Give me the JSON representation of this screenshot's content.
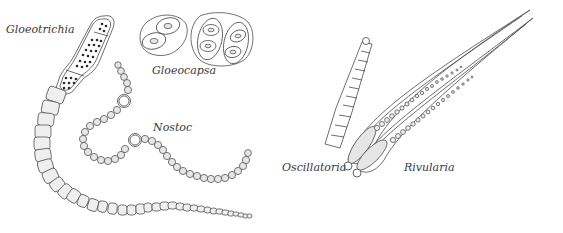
{
  "figure": {
    "background": "#ffffff",
    "ink_color": "#4a4a4a"
  },
  "labels": {
    "gloeotrichia": "Gloeotrichia",
    "gloeocapsa": "Gloeocapsa",
    "nostoc": "Nostoc",
    "oscillatoria": "Oscillatoria",
    "rivularia": "Rivularia"
  },
  "organisms": [
    {
      "name": "Gloeotrichia",
      "form": "tapering filament with basal akinetes"
    },
    {
      "name": "Gloeocapsa",
      "form": "colonies of cells in gelatinous sheaths"
    },
    {
      "name": "Nostoc",
      "form": "bead-like chain with heterocysts"
    },
    {
      "name": "Oscillatoria",
      "form": "unbranched segmented filament"
    },
    {
      "name": "Rivularia",
      "form": "tapered whip-like filaments with basal heterocyst"
    }
  ]
}
